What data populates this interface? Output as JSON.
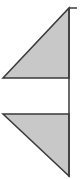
{
  "diagram": {
    "colors": {
      "fill": "#c8c8c8",
      "stroke": "#3a3a3a",
      "background": "#ffffff"
    },
    "vertical_line": {
      "x": 69,
      "y1": 8,
      "y2": 177
    },
    "top_tick": {
      "x1": 69,
      "x2": 77,
      "y": 8
    },
    "upper_triangle": {
      "points": "69,8 69,78 3,78"
    },
    "lower_triangle": {
      "points": "3,114 69,114 69,176"
    }
  }
}
